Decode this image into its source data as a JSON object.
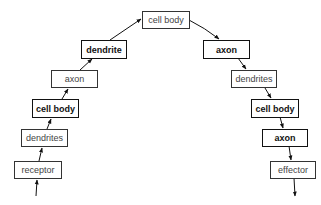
{
  "diagram": {
    "type": "flow",
    "nodes": [
      {
        "id": "receptor",
        "label": "receptor",
        "bold": false
      },
      {
        "id": "dendrites_l",
        "label": "dendrites",
        "bold": false
      },
      {
        "id": "cellbody_l",
        "label": "cell body",
        "bold": true
      },
      {
        "id": "axon_l",
        "label": "axon",
        "bold": false
      },
      {
        "id": "dendrite",
        "label": "dendrite",
        "bold": true
      },
      {
        "id": "cellbody_top",
        "label": "cell body",
        "bold": false
      },
      {
        "id": "axon_r1",
        "label": "axon",
        "bold": true
      },
      {
        "id": "dendrites_r",
        "label": "dendrites",
        "bold": false
      },
      {
        "id": "cellbody_r",
        "label": "cell body",
        "bold": true
      },
      {
        "id": "axon_r2",
        "label": "axon",
        "bold": true
      },
      {
        "id": "effector",
        "label": "effector",
        "bold": false
      }
    ],
    "edges": [
      [
        "input",
        "receptor"
      ],
      [
        "receptor",
        "dendrites_l"
      ],
      [
        "dendrites_l",
        "cellbody_l"
      ],
      [
        "cellbody_l",
        "axon_l"
      ],
      [
        "axon_l",
        "dendrite"
      ],
      [
        "dendrite",
        "cellbody_top"
      ],
      [
        "cellbody_top",
        "axon_r1"
      ],
      [
        "axon_r1",
        "dendrites_r"
      ],
      [
        "dendrites_r",
        "cellbody_r"
      ],
      [
        "cellbody_r",
        "axon_r2"
      ],
      [
        "axon_r2",
        "effector"
      ],
      [
        "effector",
        "output"
      ]
    ]
  }
}
